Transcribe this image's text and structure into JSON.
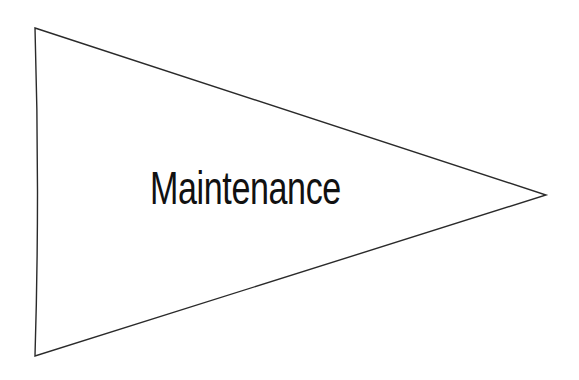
{
  "diagram": {
    "shape": "pennant-triangle",
    "label": "Maintenance",
    "stroke_color": "#2a2a2a",
    "fill_color": "#ffffff",
    "text_color": "#111111",
    "vertices": {
      "top_left": [
        35,
        28
      ],
      "right": [
        546,
        195
      ],
      "bottom_left": [
        35,
        356
      ]
    }
  }
}
